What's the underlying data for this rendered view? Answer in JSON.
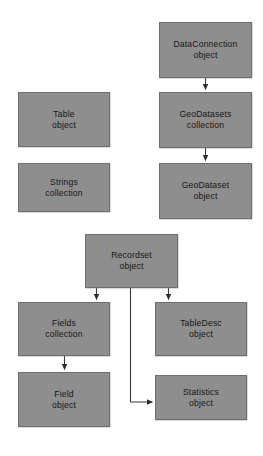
{
  "diagram": {
    "type": "object-model-diagram",
    "background_color": "#ffffff",
    "node_fill_color": "#8e8e8e",
    "node_border_color": "#6f6f6f",
    "connector_color": "#3a3a3a",
    "text_color": "#161616",
    "nodes": [
      {
        "id": "dataconnection",
        "line1": "DataConnection",
        "line2": "object",
        "x": 159,
        "y": 22,
        "width": 93,
        "height": 56
      },
      {
        "id": "table",
        "line1": "Table",
        "line2": "object",
        "x": 18,
        "y": 92,
        "width": 92,
        "height": 55
      },
      {
        "id": "geodatasets",
        "line1": "GeoDatasets",
        "line2": "collection",
        "x": 159,
        "y": 92,
        "width": 93,
        "height": 56
      },
      {
        "id": "strings",
        "line1": "Strings",
        "line2": "collection",
        "x": 18,
        "y": 163,
        "width": 92,
        "height": 49
      },
      {
        "id": "geodataset",
        "line1": "GeoDataset",
        "line2": "object",
        "x": 159,
        "y": 163,
        "width": 93,
        "height": 56
      },
      {
        "id": "recordset",
        "line1": "Recordset",
        "line2": "object",
        "x": 85,
        "y": 234,
        "width": 93,
        "height": 54
      },
      {
        "id": "fields",
        "line1": "Fields",
        "line2": "collection",
        "x": 18,
        "y": 302,
        "width": 92,
        "height": 54
      },
      {
        "id": "tabledesc",
        "line1": "TableDesc",
        "line2": "object",
        "x": 155,
        "y": 302,
        "width": 92,
        "height": 54
      },
      {
        "id": "field",
        "line1": "Field",
        "line2": "object",
        "x": 18,
        "y": 372,
        "width": 92,
        "height": 55
      },
      {
        "id": "statistics",
        "line1": "Statistics",
        "line2": "object",
        "x": 155,
        "y": 375,
        "width": 92,
        "height": 45
      }
    ],
    "connectors": [
      {
        "id": "dataconnection-to-geodatasets",
        "from": "dataconnection",
        "to": "geodatasets",
        "style": "straight-down"
      },
      {
        "id": "geodatasets-to-geodataset",
        "from": "geodatasets",
        "to": "geodataset",
        "style": "straight-down"
      },
      {
        "id": "recordset-to-fields",
        "from": "recordset",
        "to": "fields",
        "style": "straight-down"
      },
      {
        "id": "recordset-to-tabledesc",
        "from": "recordset",
        "to": "tabledesc",
        "style": "straight-down"
      },
      {
        "id": "recordset-to-statistics",
        "from": "recordset",
        "to": "statistics",
        "style": "elbow-down-right"
      },
      {
        "id": "fields-to-field",
        "from": "fields",
        "to": "field",
        "style": "straight-down"
      }
    ]
  }
}
